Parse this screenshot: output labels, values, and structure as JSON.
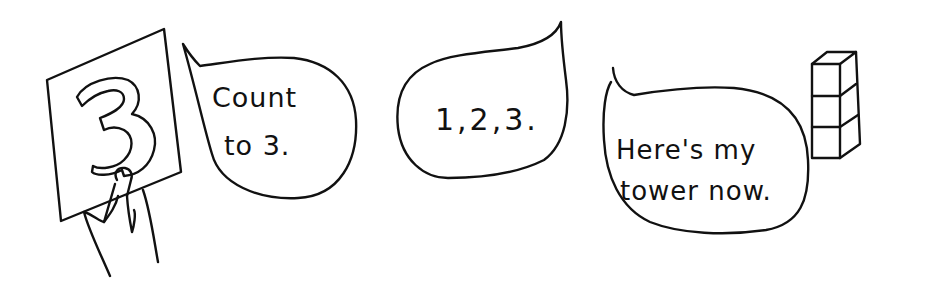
{
  "scene": {
    "card": {
      "numeral": "3"
    },
    "bubbles": [
      {
        "id": "teacher",
        "lines": [
          "Count",
          "to 3."
        ]
      },
      {
        "id": "counting",
        "lines": [
          "1,2,3."
        ]
      },
      {
        "id": "child",
        "lines": [
          "Here's my",
          "tower now."
        ]
      }
    ],
    "tower": {
      "cube_count": 3
    }
  },
  "colors": {
    "ink": "#111111",
    "background": "#ffffff"
  }
}
